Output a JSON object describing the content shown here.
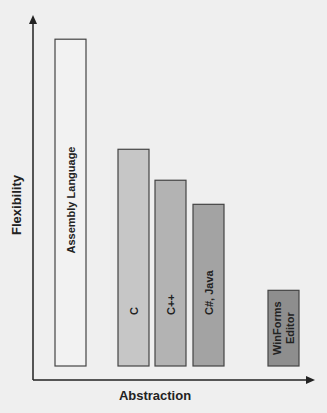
{
  "chart_data": {
    "type": "bar",
    "title": "",
    "xlabel": "Abstraction",
    "ylabel": "Flexibility",
    "categories": [
      "Assembly Language",
      "C",
      "C++",
      "C#, Java",
      "WinForms Editor"
    ],
    "values": [
      95,
      63,
      54,
      47,
      22
    ],
    "ylim": [
      0,
      100
    ],
    "grid": false,
    "legend": "none",
    "colors": [
      "#f2f2f2",
      "#c6c6c6",
      "#b3b3b3",
      "#a3a3a3",
      "#8e8e8e"
    ],
    "bar_labels": [
      "Assembly Language",
      "C",
      "C++",
      "C#, Java",
      [
        "WinForms",
        "Editor"
      ]
    ]
  }
}
